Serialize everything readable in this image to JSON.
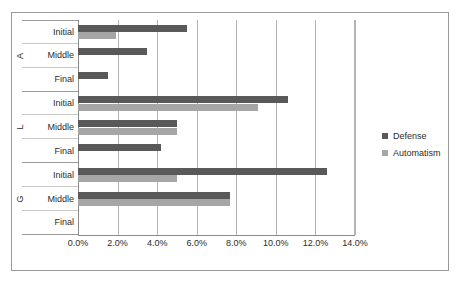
{
  "chart_data": {
    "type": "bar",
    "orientation": "horizontal",
    "title": "",
    "xlabel": "",
    "ylabel": "",
    "xlim": [
      0,
      14
    ],
    "value_format": "percent",
    "grid": true,
    "legend_position": "right",
    "tick_labels": [
      "0.0%",
      "2.0%",
      "4.0%",
      "6.0%",
      "8.0%",
      "10.0%",
      "12.0%",
      "14.0%"
    ],
    "tick_values": [
      0,
      2,
      4,
      6,
      8,
      10,
      12,
      14
    ],
    "groups": [
      {
        "label": "A",
        "categories": [
          "Initial",
          "Middle",
          "Final"
        ]
      },
      {
        "label": "L",
        "categories": [
          "Initial",
          "Middle",
          "Final"
        ]
      },
      {
        "label": "G",
        "categories": [
          "Initial",
          "Middle",
          "Final"
        ]
      }
    ],
    "categories": [
      "A Initial",
      "A Middle",
      "A Final",
      "L Initial",
      "L Middle",
      "L Final",
      "G Initial",
      "G Middle",
      "G Final"
    ],
    "series": [
      {
        "name": "Defense",
        "color": "#595959",
        "values": [
          5.5,
          3.5,
          1.5,
          10.6,
          5.0,
          4.2,
          12.6,
          7.7,
          0.0
        ]
      },
      {
        "name": "Automatism",
        "color": "#a6a6a6",
        "values": [
          1.9,
          0.0,
          0.0,
          9.1,
          5.0,
          0.0,
          5.0,
          7.7,
          0.0
        ]
      }
    ]
  }
}
